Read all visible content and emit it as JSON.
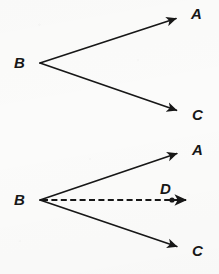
{
  "figure": {
    "background_color": "#fbfbfa",
    "stroke_color": "#171717",
    "label_color": "#171717",
    "width": 219,
    "height": 274
  },
  "diagrams": [
    {
      "id": "upper-angle",
      "name": "angle-abc-upper",
      "vertex": {
        "label": "B",
        "x": 40,
        "y": 63,
        "label_x": 14,
        "label_y": 55
      },
      "rays": [
        {
          "name": "ray-b-to-a",
          "from": {
            "x": 40,
            "y": 63
          },
          "to": {
            "x": 180,
            "y": 16
          },
          "style": "solid",
          "arrow": true,
          "endpoint_label": "A",
          "label_x": 191,
          "label_y": 7
        },
        {
          "name": "ray-b-to-c",
          "from": {
            "x": 40,
            "y": 63
          },
          "to": {
            "x": 181,
            "y": 112
          },
          "style": "solid",
          "arrow": true,
          "endpoint_label": "C",
          "label_x": 192,
          "label_y": 108
        }
      ],
      "points": []
    },
    {
      "id": "lower-angle",
      "name": "angle-abc-with-bisector",
      "vertex": {
        "label": "B",
        "x": 40,
        "y": 200,
        "label_x": 14,
        "label_y": 192
      },
      "rays": [
        {
          "name": "ray-b-to-a",
          "from": {
            "x": 40,
            "y": 200
          },
          "to": {
            "x": 181,
            "y": 152
          },
          "style": "solid",
          "arrow": true,
          "endpoint_label": "A",
          "label_x": 192,
          "label_y": 143
        },
        {
          "name": "ray-b-to-d",
          "from": {
            "x": 40,
            "y": 200
          },
          "to": {
            "x": 191,
            "y": 200
          },
          "style": "dashed",
          "arrow": true,
          "endpoint_label": "D",
          "label_x": 160,
          "label_y": 182
        },
        {
          "name": "ray-b-to-c",
          "from": {
            "x": 40,
            "y": 200
          },
          "to": {
            "x": 181,
            "y": 248
          },
          "style": "solid",
          "arrow": true,
          "endpoint_label": "C",
          "label_x": 192,
          "label_y": 244
        }
      ],
      "points": [
        {
          "name": "point-d",
          "label": "D",
          "x": 172,
          "y": 200,
          "radius": 2.6
        }
      ]
    }
  ],
  "labels": {
    "upper_b": "B",
    "upper_a": "A",
    "upper_c": "C",
    "lower_b": "B",
    "lower_a": "A",
    "lower_c": "C",
    "lower_d": "D"
  }
}
